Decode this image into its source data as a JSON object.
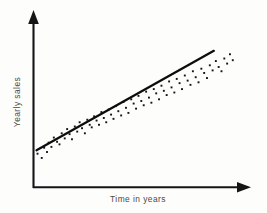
{
  "chart_data": {
    "type": "scatter",
    "title": "",
    "subtitle": "",
    "xlabel": "Time in years",
    "ylabel": "Yearly sales",
    "grid": false,
    "legend": null,
    "legend_position": "none",
    "axis_style": "arrow-headed open axes, no tick marks, no tick labels",
    "xlim": [
      0,
      100
    ],
    "ylim": [
      0,
      100
    ],
    "annotations": [],
    "series": [
      {
        "name": "Observed yearly sales",
        "type": "scatter",
        "marker": "small filled square dot",
        "color": "#141414",
        "x": [
          1.5,
          3.6,
          4.8,
          6.2,
          7.0,
          8.4,
          9.6,
          11.2,
          12.4,
          13.5,
          15.0,
          16.2,
          17.4,
          18.6,
          20.0,
          21.2,
          22.4,
          23.6,
          25.0,
          26.2,
          27.4,
          28.4,
          29.6,
          30.8,
          32.0,
          33.2,
          34.4,
          35.6,
          36.8,
          38.0,
          39.2,
          40.4,
          41.6,
          43.0,
          44.2,
          45.4,
          46.6,
          48.0,
          49.2,
          50.4,
          51.6,
          53.0,
          54.2,
          55.4,
          56.8,
          58.0,
          59.2,
          60.4,
          61.8,
          63.0,
          64.2,
          65.6,
          66.8,
          68.0,
          69.4,
          70.6,
          72.0,
          73.2,
          74.6,
          76.0,
          77.4,
          78.6,
          80.0,
          81.4,
          82.8,
          84.2,
          85.6,
          87.0,
          88.4,
          90.0,
          91.4,
          92.8,
          94.2,
          95.6,
          97.0,
          98.4
        ],
        "y": [
          19.0,
          16.5,
          22.5,
          20.0,
          25.5,
          23.0,
          28.5,
          26.0,
          24.5,
          31.0,
          28.0,
          33.5,
          30.5,
          27.5,
          35.0,
          32.0,
          37.5,
          34.0,
          31.0,
          39.0,
          36.0,
          34.5,
          41.0,
          38.5,
          36.0,
          43.5,
          40.0,
          37.5,
          45.0,
          42.0,
          39.5,
          47.0,
          44.0,
          41.5,
          49.5,
          46.0,
          43.0,
          51.0,
          48.5,
          45.5,
          53.0,
          50.0,
          47.5,
          55.5,
          52.0,
          49.0,
          57.0,
          54.5,
          51.0,
          59.0,
          56.0,
          53.5,
          61.5,
          58.0,
          55.0,
          63.0,
          60.5,
          57.0,
          65.0,
          62.0,
          59.5,
          67.5,
          64.0,
          61.0,
          69.0,
          66.5,
          63.5,
          71.0,
          68.0,
          73.5,
          70.0,
          67.5,
          75.0,
          72.0,
          77.5,
          74.0
        ]
      },
      {
        "name": "Fitted trend line",
        "type": "line",
        "color": "#0d0d0d",
        "x": [
          1.0,
          89.0
        ],
        "y": [
          21.0,
          79.5
        ]
      }
    ]
  },
  "labels": {
    "x_axis_title": "Time in years",
    "y_axis_title": "Yearly sales"
  },
  "icons": {
    "x_axis_arrow": "arrow-right-icon",
    "y_axis_arrow": "arrow-up-icon"
  }
}
